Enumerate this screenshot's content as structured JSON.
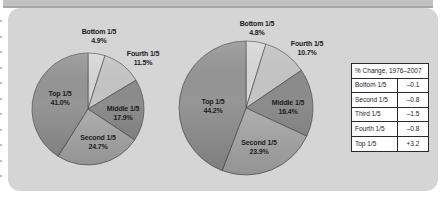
{
  "figure": {
    "panel_color": "#d5d5d5",
    "top_band_color": "#c2c2c2",
    "top_band_edge_color": "#a6a6a6"
  },
  "chart_data": [
    {
      "type": "pie",
      "name": "income-share-pie-left",
      "title": "",
      "categories": [
        "Bottom 1/5",
        "Fourth 1/5",
        "Middle 1/5",
        "Second 1/5",
        "Top 1/5"
      ],
      "values": [
        4.9,
        11.5,
        17.9,
        24.7,
        41.0
      ],
      "value_labels": [
        "4.9%",
        "11.5%",
        "17.9%",
        "24.7%",
        "41.0%"
      ],
      "colors": [
        "#d9d9d9",
        "#c7c7c7",
        "#8d8d8d",
        "#b1b1b1",
        "#969696"
      ],
      "start_angle_deg": 0,
      "direction": "clockwise",
      "legend": "none",
      "layout": {
        "cx": 88,
        "cy": 109,
        "r": 56,
        "label_pos": [
          [
            99,
            33.5
          ],
          [
            143,
            55.5
          ],
          [
            123,
            110.5
          ],
          [
            98,
            139.5
          ],
          [
            60,
            95.5
          ]
        ]
      }
    },
    {
      "type": "pie",
      "name": "income-share-pie-right",
      "title": "",
      "categories": [
        "Bottom 1/5",
        "Fourth 1/5",
        "Middle 1/5",
        "Second 1/5",
        "Top 1/5"
      ],
      "values": [
        4.8,
        10.7,
        16.4,
        23.9,
        44.2
      ],
      "value_labels": [
        "4.8%",
        "10.7%",
        "16.4%",
        "23.9%",
        "44.2%"
      ],
      "colors": [
        "#d9d9d9",
        "#c7c7c7",
        "#8d8d8d",
        "#b1b1b1",
        "#969696"
      ],
      "start_angle_deg": 0,
      "direction": "clockwise",
      "legend": "none",
      "layout": {
        "cx": 246,
        "cy": 108,
        "r": 67,
        "label_pos": [
          [
            257,
            26
          ],
          [
            307,
            46
          ],
          [
            288,
            104.5
          ],
          [
            259,
            144.5
          ],
          [
            213,
            103.5
          ]
        ]
      }
    }
  ],
  "table": {
    "header": "% Change, 1976–2007",
    "rows": [
      {
        "label": "Bottom 1/5",
        "value": "–0.1"
      },
      {
        "label": "Second 1/5",
        "value": "–0.8"
      },
      {
        "label": "Third 1/5",
        "value": "–1.5"
      },
      {
        "label": "Fourth 1/5",
        "value": "–0.8"
      },
      {
        "label": "Top 1/5",
        "value": "+3.2"
      }
    ]
  }
}
